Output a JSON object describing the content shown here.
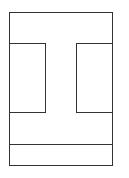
{
  "canvas": {
    "width": 129,
    "height": 178,
    "background": "#ffffff"
  },
  "stroke": {
    "color": "#333333",
    "width": 1
  },
  "shapes": {
    "outer_frame": {
      "x": 9.5,
      "y": 12.5,
      "w": 103,
      "h": 153
    },
    "left_panel": {
      "x": 9.5,
      "y": 43.5,
      "w": 36,
      "h": 69
    },
    "right_panel": {
      "x": 76.5,
      "y": 43.5,
      "w": 36,
      "h": 69
    },
    "divider": {
      "x1": 9.5,
      "y1": 144.5,
      "x2": 112.5,
      "y2": 144.5
    }
  }
}
